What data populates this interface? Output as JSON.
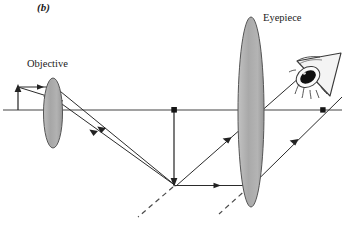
{
  "figure": {
    "panel_label": "(b)",
    "caption_elements": {
      "objective_label": "Objective",
      "eyepiece_label": "Eyepiece"
    },
    "colors": {
      "background": "#ffffff",
      "line": "#2b2b2b",
      "lens_fill": "#a8a8a8",
      "lens_stroke": "#4a4a4a",
      "text": "#1a1a1a",
      "eye_fill": "#f2f2f2",
      "pupil": "#1a1a1a"
    },
    "optics": {
      "diagram_type": "ray-diagram",
      "instrument": "compound-microscope",
      "optical_axis": {
        "y": 110,
        "x_start": 3,
        "x_end": 342
      },
      "objective_lens": {
        "cx": 53,
        "cy": 113,
        "rx": 9.5,
        "ry": 35
      },
      "eyepiece_lens": {
        "cx": 251,
        "cy": 112,
        "rx": 13,
        "ry": 95
      },
      "object_arrow": {
        "x": 18,
        "y_base": 110,
        "y_tip": 88,
        "direction": "up"
      },
      "intermediate_image_arrow": {
        "x": 174,
        "y_base": 110,
        "y_tip": 185,
        "direction": "down"
      },
      "axis_points": [
        {
          "x": 174,
          "y": 110,
          "name": "intermediate-image-axis-point"
        },
        {
          "x": 323,
          "y": 110,
          "name": "exit-ray-axis-point"
        }
      ],
      "ray_count": 5,
      "dashed_construction_lines": 2
    }
  }
}
